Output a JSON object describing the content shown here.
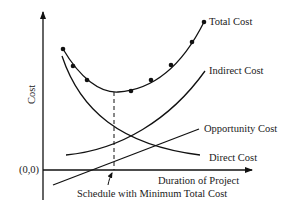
{
  "diagram": {
    "title": "",
    "y_axis_label": "Cost",
    "x_axis_label": "Duration of Project",
    "origin_label": "(0,0)",
    "annotation": "Schedule with Minimum Total Cost",
    "curves": [
      {
        "name": "Total Cost",
        "style": "solid with dot markers"
      },
      {
        "name": "Indirect Cost",
        "style": "solid"
      },
      {
        "name": "Opportunity Cost",
        "style": "solid straight"
      },
      {
        "name": "Direct Cost",
        "style": "solid"
      }
    ],
    "min_total_cost_marker": "dashed vertical line"
  },
  "colors": {
    "line": "#111111",
    "background": "#ffffff"
  }
}
